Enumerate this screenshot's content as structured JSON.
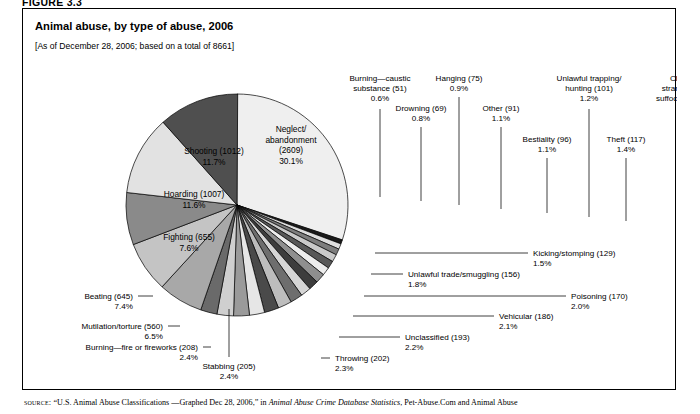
{
  "figure": {
    "label": "FIGURE 3.3"
  },
  "chart_title": "Animal abuse, by type of abuse, 2006",
  "chart_subtitle": "[As of December 28, 2006; based on a total of 8661]",
  "source": {
    "keyword": "source:",
    "text_before_italic": " “U.S. Animal Abuse Classifications —Graphed Dec 28, 2006,” in ",
    "italic_title": "Animal Abuse Crime Database Statistics",
    "text_after_italic": ", Pet-Abuse.Com and Animal Abuse"
  },
  "chart_data": {
    "type": "pie",
    "title": "Animal abuse, by type of abuse, 2006",
    "subtitle": "[As of December 28, 2006; based on a total of 8661]",
    "total": 8661,
    "units": "incidents",
    "start_angle_deg": -90,
    "direction": "clockwise",
    "legend": "none",
    "labels_in_slices": [
      "Neglect/abandonment",
      "Shooting",
      "Hoarding",
      "Fighting"
    ],
    "slices": [
      {
        "label": "Neglect/\nabandonment",
        "name": "Neglect/abandonment",
        "value": 2609,
        "percent": 30.1,
        "color": "#efefef",
        "label_mode": "inside"
      },
      {
        "label": "Burning—caustic\nsubstance",
        "name": "Burning—caustic substance",
        "value": 51,
        "percent": 0.6,
        "color": "#1a1a1a",
        "label_mode": "callout"
      },
      {
        "label": "Drowning",
        "name": "Drowning",
        "value": 69,
        "percent": 0.8,
        "color": "#dedede",
        "label_mode": "callout"
      },
      {
        "label": "Hanging",
        "name": "Hanging",
        "value": 75,
        "percent": 0.9,
        "color": "#7d7d7d",
        "label_mode": "callout"
      },
      {
        "label": "Other",
        "name": "Other",
        "value": 91,
        "percent": 1.1,
        "color": "#c9c9c9",
        "label_mode": "callout"
      },
      {
        "label": "Bestiality",
        "name": "Bestiality",
        "value": 96,
        "percent": 1.1,
        "color": "#585858",
        "label_mode": "callout"
      },
      {
        "label": "Unlawful trapping/\nhunting",
        "name": "Unlawful trapping/hunting",
        "value": 101,
        "percent": 1.2,
        "color": "#ededed",
        "label_mode": "callout"
      },
      {
        "label": "Theft",
        "name": "Theft",
        "value": 117,
        "percent": 1.4,
        "color": "#8f8f8f",
        "label_mode": "callout"
      },
      {
        "label": "Choking/\nstrangulation/\nsuffocation",
        "name": "Choking/strangulation/suffocation",
        "value": 124,
        "percent": 1.4,
        "color": "#3d3d3d",
        "label_mode": "callout"
      },
      {
        "label": "Kicking/stomping",
        "name": "Kicking/stomping",
        "value": 129,
        "percent": 1.5,
        "color": "#d6d6d6",
        "label_mode": "callout"
      },
      {
        "label": "Unlawful trade/smuggling",
        "name": "Unlawful trade/smuggling",
        "value": 156,
        "percent": 1.8,
        "color": "#6e6e6e",
        "label_mode": "callout"
      },
      {
        "label": "Poisoning",
        "name": "Poisoning",
        "value": 170,
        "percent": 2.0,
        "color": "#bdbdbd",
        "label_mode": "callout"
      },
      {
        "label": "Vehicular",
        "name": "Vehicular",
        "value": 186,
        "percent": 2.1,
        "color": "#4a4a4a",
        "label_mode": "callout"
      },
      {
        "label": "Unclassified",
        "name": "Unclassified",
        "value": 193,
        "percent": 2.2,
        "color": "#e6e6e6",
        "label_mode": "callout"
      },
      {
        "label": "Throwing",
        "name": "Throwing",
        "value": 202,
        "percent": 2.3,
        "color": "#9a9a9a",
        "label_mode": "callout"
      },
      {
        "label": "Stabbing",
        "name": "Stabbing",
        "value": 205,
        "percent": 2.4,
        "color": "#cfcfcf",
        "label_mode": "callout"
      },
      {
        "label": "Burning—fire or fireworks",
        "name": "Burning—fire or fireworks",
        "value": 208,
        "percent": 2.4,
        "color": "#6a6a6a",
        "label_mode": "callout"
      },
      {
        "label": "Mutilation/torture",
        "name": "Mutilation/torture",
        "value": 560,
        "percent": 6.5,
        "color": "#a8a8a8",
        "label_mode": "callout"
      },
      {
        "label": "Beating",
        "name": "Beating",
        "value": 645,
        "percent": 7.4,
        "color": "#c4c4c4",
        "label_mode": "callout"
      },
      {
        "label": "Fighting",
        "name": "Fighting",
        "value": 655,
        "percent": 7.6,
        "color": "#8a8a8a",
        "label_mode": "inside"
      },
      {
        "label": "Hoarding",
        "name": "Hoarding",
        "value": 1007,
        "percent": 11.6,
        "color": "#e2e2e2",
        "label_mode": "inside"
      },
      {
        "label": "Shooting",
        "name": "Shooting",
        "value": 1012,
        "percent": 11.7,
        "color": "#4f4f4f",
        "label_mode": "inside"
      }
    ]
  },
  "callouts": [
    {
      "key": "burning-caustic-substance",
      "lines": [
        "Burning—caustic",
        "substance (51)",
        "0.6%"
      ],
      "tx": 357,
      "ty": 72,
      "anchor": "middle",
      "path": "M 357 100 L 357 188"
    },
    {
      "key": "drowning",
      "lines": [
        "Drowning (69)",
        "0.8%"
      ],
      "tx": 398,
      "ty": 102,
      "anchor": "middle",
      "path": "M 398 118 L 398 192"
    },
    {
      "key": "hanging",
      "lines": [
        "Hanging (75)",
        "0.9%"
      ],
      "tx": 436,
      "ty": 72,
      "anchor": "middle",
      "path": "M 436 88 L 436 196"
    },
    {
      "key": "other",
      "lines": [
        "Other (91)",
        "1.1%"
      ],
      "tx": 478,
      "ty": 102,
      "anchor": "middle",
      "path": "M 478 118 L 478 200"
    },
    {
      "key": "bestiality",
      "lines": [
        "Bestiality (96)",
        "1.1%"
      ],
      "tx": 524,
      "ty": 133,
      "anchor": "middle",
      "path": "M 524 149 L 524 204"
    },
    {
      "key": "unlawful-trapping-hunting",
      "lines": [
        "Unlawful trapping/",
        "hunting (101)",
        "1.2%"
      ],
      "tx": 566,
      "ty": 72,
      "anchor": "middle",
      "path": "M 566 100 L 566 208"
    },
    {
      "key": "theft",
      "lines": [
        "Theft (117)",
        "1.4%"
      ],
      "tx": 603,
      "ty": 133,
      "anchor": "middle",
      "path": "M 603 149 L 603 212"
    },
    {
      "key": "choking-strangulation-suffocation",
      "lines": [
        "Choking/",
        "strangulation/",
        "suffocation (124)",
        "1.4%"
      ],
      "tx": 663,
      "ty": 72,
      "anchor": "middle",
      "path": "M 663 110 L 663 216"
    },
    {
      "key": "kicking-stomping",
      "lines": [
        "Kicking/stomping (129)",
        "1.5%"
      ],
      "tx": 510,
      "ty": 247,
      "anchor": "start",
      "path": "M 505 244 L 352 244"
    },
    {
      "key": "unlawful-trade-smuggling",
      "lines": [
        "Unlawful trade/smuggling (156)",
        "1.8%"
      ],
      "tx": 385,
      "ty": 268,
      "anchor": "start",
      "path": "M 380 265 L 348 265"
    },
    {
      "key": "poisoning",
      "lines": [
        "Poisoning (170)",
        "2.0%"
      ],
      "tx": 548,
      "ty": 290,
      "anchor": "start",
      "path": "M 543 287 L 341 287"
    },
    {
      "key": "vehicular",
      "lines": [
        "Vehicular (186)",
        "2.1%"
      ],
      "tx": 476,
      "ty": 310,
      "anchor": "start",
      "path": "M 471 307 L 330 307"
    },
    {
      "key": "unclassified",
      "lines": [
        "Unclassified (193)",
        "2.2%"
      ],
      "tx": 382,
      "ty": 331,
      "anchor": "start",
      "path": "M 377 328 L 316 328"
    },
    {
      "key": "throwing",
      "lines": [
        "Throwing (202)",
        "2.3%"
      ],
      "tx": 312,
      "ty": 352,
      "anchor": "start",
      "path": "M 307 349 L 298 349"
    },
    {
      "key": "stabbing",
      "lines": [
        "Stabbing (205)",
        "2.4%"
      ],
      "tx": 206,
      "ty": 360,
      "anchor": "middle",
      "path": "M 206 348 L 206 300"
    },
    {
      "key": "burning-fire-or-fireworks",
      "lines": [
        "Burning—fire or fireworks (208)",
        "2.4%"
      ],
      "tx": 175,
      "ty": 341,
      "anchor": "end",
      "path": "M 180 338 L 188 338"
    },
    {
      "key": "mutilation-torture",
      "lines": [
        "Mutilation/torture (560)",
        "6.5%"
      ],
      "tx": 140,
      "ty": 320,
      "anchor": "end",
      "path": "M 145 317 L 157 317"
    },
    {
      "key": "beating",
      "lines": [
        "Beating (645)",
        "7.4%"
      ],
      "tx": 110,
      "ty": 290,
      "anchor": "end",
      "path": "M 115 287 L 130 287"
    }
  ],
  "inside_labels": [
    {
      "key": "neglect-abandonment",
      "lines": [
        "Neglect/",
        "abandonment",
        "(2609)",
        "30.1%"
      ],
      "x": 268,
      "y": 123,
      "fill": "#000"
    },
    {
      "key": "shooting",
      "lines": [
        "Shooting (1012)",
        "11.7%"
      ],
      "x": 191,
      "y": 145,
      "fill": "#ffffff"
    },
    {
      "key": "hoarding",
      "lines": [
        "Hoarding (1007)",
        "11.6%"
      ],
      "x": 171,
      "y": 188,
      "fill": "#000"
    },
    {
      "key": "fighting",
      "lines": [
        "Fighting (655)",
        "7.6%"
      ],
      "x": 166,
      "y": 231,
      "fill": "#ffffff"
    }
  ],
  "geometry": {
    "cx": 214,
    "cy": 196,
    "r": 111
  }
}
